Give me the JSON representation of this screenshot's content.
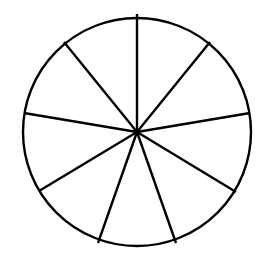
{
  "diagram": {
    "type": "circle-divided-into-sectors",
    "sector_count": 9,
    "center": [
      137,
      132
    ],
    "radius": 114,
    "stroke_color": "#000000",
    "fill_color": "#ffffff",
    "spoke_endpoints": [
      [
        137,
        14
      ],
      [
        210,
        42
      ],
      [
        250,
        113
      ],
      [
        236,
        192
      ],
      [
        176,
        243
      ],
      [
        98,
        243
      ],
      [
        39,
        191
      ],
      [
        24,
        113
      ],
      [
        64,
        42
      ]
    ]
  }
}
